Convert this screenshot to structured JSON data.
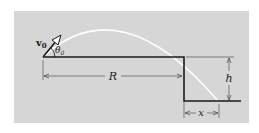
{
  "diagram": {
    "type": "projectile-off-cliff",
    "colors": {
      "background": "#ffffff",
      "panel": "#d6d6d6",
      "ground": "#1a1a1a",
      "trajectory": "#ffffff",
      "dimension": "#555555"
    },
    "labels": {
      "velocity": "v",
      "velocity_sub": "0",
      "angle": "θ",
      "angle_sub": "0",
      "range": "R",
      "height": "h",
      "distance": "x"
    }
  }
}
